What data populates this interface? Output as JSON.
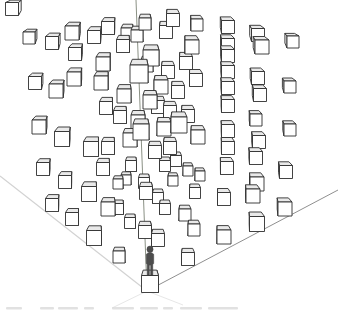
{
  "figure": {
    "width": 338,
    "height": 313,
    "background": "#ffffff",
    "vanishing_point": [
      152,
      -120
    ],
    "axes": {
      "vertical": {
        "x1": 136,
        "y1": 0,
        "x2": 147,
        "y2": 291,
        "color": "#8a9084",
        "width": 1
      },
      "left": {
        "x1": 0,
        "y1": 176,
        "x2": 147,
        "y2": 291,
        "color": "#d2d2d2",
        "width": 1.2
      },
      "right": {
        "x1": 147,
        "y1": 291,
        "x2": 338,
        "y2": 190,
        "color": "#8f8f8f",
        "width": 1
      },
      "faint_extensions": {
        "color": "#e7e7e7",
        "width": 1,
        "lines": [
          {
            "x1": 147,
            "y1": 291,
            "x2": 112,
            "y2": 308
          },
          {
            "x1": 147,
            "y1": 291,
            "x2": 183,
            "y2": 305
          }
        ]
      }
    },
    "cube_style": {
      "face_front": "#ffffff",
      "face_top": "#e9e9e9",
      "face_side": "#f5f5f5",
      "stroke": "#2e2e2e",
      "stroke_width": 0.9,
      "back_scale": 0.8,
      "depth_ratio": 0.42
    },
    "cubes": [
      [
        12,
        9,
        13
      ],
      [
        29,
        38,
        12
      ],
      [
        52,
        43,
        13
      ],
      [
        72,
        33,
        14
      ],
      [
        94,
        37,
        13
      ],
      [
        108,
        28,
        13
      ],
      [
        75,
        54,
        13
      ],
      [
        103,
        64,
        14
      ],
      [
        35,
        83,
        13
      ],
      [
        56,
        91,
        14
      ],
      [
        74,
        79,
        14
      ],
      [
        101,
        83,
        14
      ],
      [
        39,
        127,
        14
      ],
      [
        62,
        139,
        15
      ],
      [
        91,
        149,
        15
      ],
      [
        106,
        108,
        13
      ],
      [
        108,
        148,
        13
      ],
      [
        127,
        34,
        12
      ],
      [
        137,
        36,
        12
      ],
      [
        145,
        24,
        12
      ],
      [
        123,
        46,
        13
      ],
      [
        166,
        32,
        13
      ],
      [
        173,
        20,
        13
      ],
      [
        197,
        25,
        12
      ],
      [
        192,
        47,
        14
      ],
      [
        186,
        63,
        13
      ],
      [
        151,
        58,
        16
      ],
      [
        139,
        74,
        18
      ],
      [
        147,
        66,
        12
      ],
      [
        168,
        72,
        13
      ],
      [
        196,
        80,
        13
      ],
      [
        161,
        87,
        14
      ],
      [
        178,
        92,
        13
      ],
      [
        124,
        96,
        14
      ],
      [
        150,
        102,
        14
      ],
      [
        158,
        107,
        13
      ],
      [
        170,
        112,
        13
      ],
      [
        120,
        117,
        13
      ],
      [
        138,
        122,
        14
      ],
      [
        141,
        132,
        16
      ],
      [
        164,
        129,
        14
      ],
      [
        179,
        125,
        16
      ],
      [
        188,
        116,
        13
      ],
      [
        198,
        137,
        14
      ],
      [
        170,
        148,
        13
      ],
      [
        155,
        152,
        13
      ],
      [
        130,
        140,
        14
      ],
      [
        228,
        27,
        13
      ],
      [
        228,
        45,
        13
      ],
      [
        228,
        56,
        13
      ],
      [
        228,
        72,
        13
      ],
      [
        228,
        88,
        13
      ],
      [
        228,
        106,
        13
      ],
      [
        228,
        131,
        13
      ],
      [
        228,
        148,
        13
      ],
      [
        258,
        35,
        13
      ],
      [
        262,
        47,
        14
      ],
      [
        293,
        42,
        12
      ],
      [
        258,
        78,
        13
      ],
      [
        260,
        95,
        13
      ],
      [
        290,
        87,
        12
      ],
      [
        256,
        120,
        12
      ],
      [
        290,
        130,
        12
      ],
      [
        259,
        142,
        13
      ],
      [
        43,
        169,
        13
      ],
      [
        65,
        182,
        13
      ],
      [
        89,
        194,
        15
      ],
      [
        103,
        169,
        13
      ],
      [
        52,
        205,
        13
      ],
      [
        72,
        219,
        13
      ],
      [
        94,
        238,
        15
      ],
      [
        108,
        209,
        14
      ],
      [
        126,
        180,
        10
      ],
      [
        118,
        184,
        10
      ],
      [
        131,
        166,
        11
      ],
      [
        165,
        166,
        11
      ],
      [
        176,
        161,
        11
      ],
      [
        188,
        171,
        10
      ],
      [
        200,
        176,
        10
      ],
      [
        144,
        183,
        11
      ],
      [
        146,
        193,
        13
      ],
      [
        158,
        198,
        11
      ],
      [
        173,
        181,
        10
      ],
      [
        195,
        193,
        11
      ],
      [
        165,
        209,
        11
      ],
      [
        118,
        209,
        11
      ],
      [
        130,
        223,
        11
      ],
      [
        185,
        215,
        12
      ],
      [
        194,
        230,
        12
      ],
      [
        145,
        232,
        13
      ],
      [
        158,
        240,
        13
      ],
      [
        119,
        257,
        12
      ],
      [
        188,
        259,
        13
      ],
      [
        150,
        284,
        17
      ],
      [
        256,
        158,
        13
      ],
      [
        286,
        172,
        13
      ],
      [
        257,
        184,
        14
      ],
      [
        253,
        196,
        14
      ],
      [
        285,
        209,
        14
      ],
      [
        257,
        224,
        15
      ],
      [
        227,
        168,
        13
      ],
      [
        224,
        199,
        13
      ],
      [
        224,
        237,
        14
      ]
    ],
    "person": {
      "cx": 150,
      "feet_y": 275,
      "height": 29,
      "color": "#4d4d4d",
      "outline": "#3a3a3a"
    },
    "caption_fragments": {
      "y": 307,
      "height": 2.5,
      "color": "#d9d9d9",
      "segments": [
        [
          6,
          16
        ],
        [
          40,
          14
        ],
        [
          58,
          20
        ],
        [
          84,
          10
        ],
        [
          112,
          22
        ],
        [
          140,
          18
        ],
        [
          163,
          10
        ],
        [
          180,
          22
        ],
        [
          208,
          30
        ]
      ]
    }
  }
}
